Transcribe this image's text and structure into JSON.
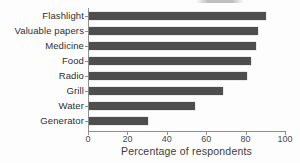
{
  "colors": {
    "bar": "#4e4e4e",
    "axis": "#8f8f8f",
    "category_label": "#2f2f2f",
    "tick_label": "#4a4a4a",
    "axis_title": "#3b3b3b",
    "background": "#fdfdfd"
  },
  "chart_data": {
    "type": "bar",
    "orientation": "horizontal",
    "categories": [
      "Flashlight",
      "Valuable papers",
      "Medicine",
      "Food",
      "Radio",
      "Grill",
      "Water",
      "Generator"
    ],
    "values": [
      90,
      86,
      85,
      82,
      80,
      68,
      54,
      30
    ],
    "title": "",
    "xlabel": "Percentage of respondents",
    "ylabel": "",
    "xlim": [
      0,
      100
    ],
    "xticks": [
      0,
      20,
      40,
      60,
      80,
      100
    ],
    "grid": false,
    "legend": false
  }
}
